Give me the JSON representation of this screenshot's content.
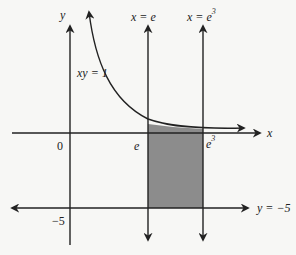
{
  "diagram": {
    "type": "region-bounded-by-curves",
    "colors": {
      "line": "#222222",
      "shade": "#8c8c8c",
      "background": "#f7f7f5"
    },
    "labels": {
      "y_axis": "y",
      "x_axis": "x",
      "origin": "0",
      "curve": "xy = 1",
      "line_x_e": "x = e",
      "line_x_e3_base": "x = e",
      "line_x_e3_exp": "3",
      "tick_e": "e",
      "tick_e3_base": "e",
      "tick_e3_exp": "3",
      "tick_neg5": "−5",
      "line_y_neg5": "y = −5"
    },
    "elements": [
      {
        "name": "y-axis",
        "kind": "axis",
        "direction": "vertical"
      },
      {
        "name": "x-axis",
        "kind": "axis",
        "direction": "horizontal"
      },
      {
        "name": "curve-xy-1",
        "kind": "hyperbola",
        "equation": "xy = 1"
      },
      {
        "name": "line-x-e",
        "kind": "vertical-line",
        "equation": "x = e"
      },
      {
        "name": "line-x-e3",
        "kind": "vertical-line",
        "equation": "x = e^3"
      },
      {
        "name": "line-y-neg5",
        "kind": "horizontal-line",
        "equation": "y = -5"
      },
      {
        "name": "shaded-region",
        "kind": "area",
        "bounds": "e <= x <= e^3, -5 <= y <= 1/x"
      }
    ]
  }
}
